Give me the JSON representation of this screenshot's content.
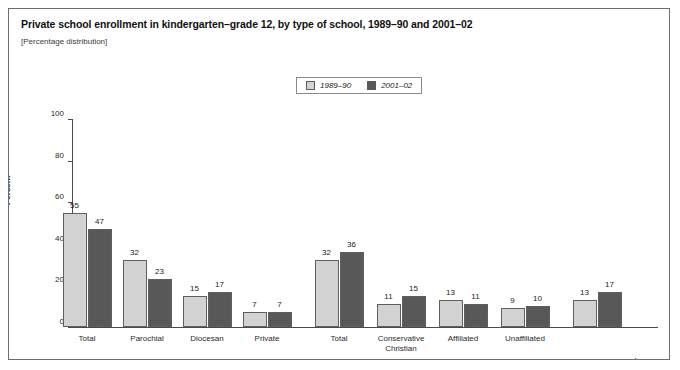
{
  "figure": {
    "title": "Private school enrollment in kindergarten–grade 12, by type of school, 1989–90 and 2001–02",
    "subtitle": "[Percentage distribution]"
  },
  "legend": {
    "items": [
      {
        "label": "1989–90",
        "swatch": "light-gray-swatch",
        "color": "#d2d2d2"
      },
      {
        "label": "2001–02",
        "swatch": "dark-gray-swatch",
        "color": "#585858"
      }
    ]
  },
  "axis": {
    "y_title": "Percent",
    "y_ticks": [
      "0",
      "20",
      "40",
      "60",
      "80",
      "100"
    ]
  },
  "groups": [
    {
      "label": "Catholic",
      "superscript": ""
    },
    {
      "label": "Other religious",
      "superscript": "a"
    },
    {
      "label": "Nonsectarian",
      "superscript": "b"
    }
  ],
  "chart_data": {
    "type": "bar",
    "title": "Private school enrollment in kindergarten–grade 12, by type of school, 1989–90 and 2001–02",
    "subtitle": "[Percentage distribution]",
    "xlabel": "",
    "ylabel": "Percent",
    "ylim": [
      0,
      100
    ],
    "yticks": [
      0,
      20,
      40,
      60,
      80,
      100
    ],
    "grid": false,
    "legend_position": "top-center",
    "categories": [
      "Total",
      "Parochial",
      "Diocesan",
      "Private",
      "Total",
      "Conservative Christian",
      "Affiliated",
      "Unaffiliated",
      "Nonsectarian"
    ],
    "group_of_category": [
      "Catholic",
      "Catholic",
      "Catholic",
      "Catholic",
      "Other religious",
      "Other religious",
      "Other religious",
      "Other religious",
      "Nonsectarian"
    ],
    "series": [
      {
        "name": "1989–90",
        "color": "#d2d2d2",
        "values": [
          55,
          32,
          15,
          7,
          32,
          11,
          13,
          9,
          13
        ]
      },
      {
        "name": "2001–02",
        "color": "#585858",
        "values": [
          47,
          23,
          17,
          7,
          36,
          15,
          11,
          10,
          17
        ]
      }
    ]
  },
  "bars": [
    {
      "category": "Total",
      "line1": "Total",
      "line2": "",
      "v1": 55,
      "v2": 47
    },
    {
      "category": "Parochial",
      "line1": "Parochial",
      "line2": "",
      "v1": 32,
      "v2": 23
    },
    {
      "category": "Diocesan",
      "line1": "Diocesan",
      "line2": "",
      "v1": 15,
      "v2": 17
    },
    {
      "category": "Private",
      "line1": "Private",
      "line2": "",
      "v1": 7,
      "v2": 7
    },
    {
      "category": "Total",
      "line1": "Total",
      "line2": "",
      "v1": 32,
      "v2": 36
    },
    {
      "category": "Conservative Christian",
      "line1": "Conservative",
      "line2": "Christian",
      "v1": 11,
      "v2": 15
    },
    {
      "category": "Affiliated",
      "line1": "Affiliated",
      "line2": "",
      "v1": 13,
      "v2": 11
    },
    {
      "category": "Unaffiliated",
      "line1": "Unaffiliated",
      "line2": "",
      "v1": 9,
      "v2": 10
    },
    {
      "category": "Nonsectarian",
      "line1": "",
      "line2": "",
      "v1": 13,
      "v2": 17
    }
  ]
}
